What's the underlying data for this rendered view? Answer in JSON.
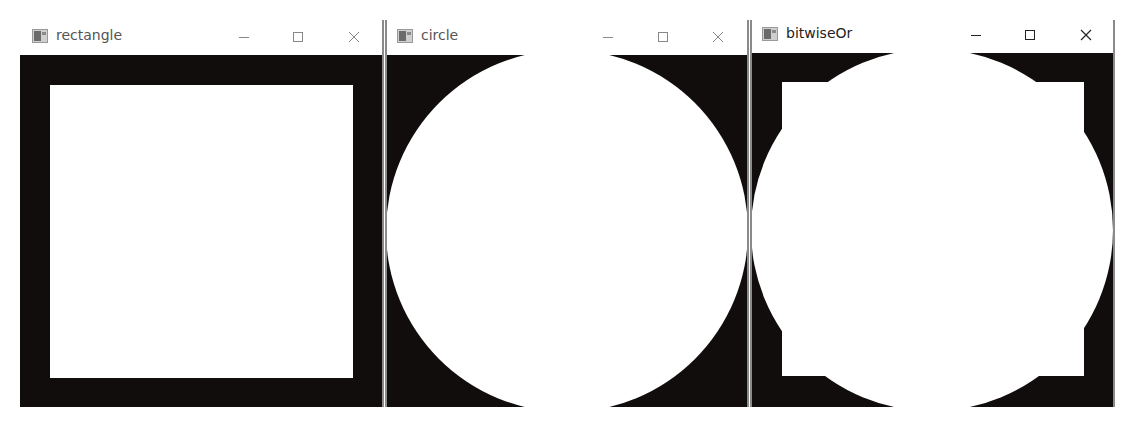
{
  "windows": [
    {
      "id": "rectangle",
      "title": "rectangle",
      "active": false,
      "controls": {
        "minimize": "minimize-icon",
        "maximize": "maximize-icon",
        "close": "close-icon"
      },
      "canvas": {
        "background": "#120d0d",
        "foreground": "#ffffff",
        "shape": "rectangle"
      }
    },
    {
      "id": "circle",
      "title": "circle",
      "active": false,
      "controls": {
        "minimize": "minimize-icon",
        "maximize": "maximize-icon",
        "close": "close-icon"
      },
      "canvas": {
        "background": "#120d0d",
        "foreground": "#ffffff",
        "shape": "circle"
      }
    },
    {
      "id": "bitwiseOr",
      "title": "bitwiseOr",
      "active": true,
      "controls": {
        "minimize": "minimize-icon",
        "maximize": "maximize-icon",
        "close": "close-icon"
      },
      "canvas": {
        "background": "#120d0d",
        "foreground": "#ffffff",
        "shape": "rectangle OR circle"
      }
    }
  ]
}
